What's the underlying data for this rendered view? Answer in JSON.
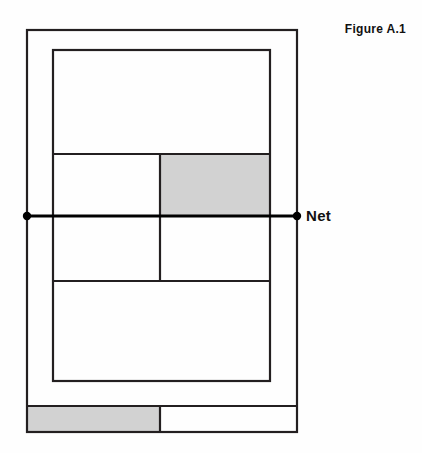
{
  "figure": {
    "caption": "Figure A.1",
    "title_text": "Figure A.1"
  },
  "labels": {
    "net": "Net",
    "caption": "Figure A.1"
  },
  "colors": {
    "background": "#fefefe",
    "line": "#231f20",
    "shade_fill": "#d2d2d2",
    "court_fill": "#ffffff",
    "post_fill": "#000000",
    "text": "#111111"
  },
  "geometry": {
    "doubles_court": {
      "x": 27,
      "y": 30,
      "width": 270,
      "height": 402
    },
    "singles_court": {
      "x": 53,
      "y": 50,
      "width": 217,
      "height": 331
    },
    "service_line_near": {
      "y": 154
    },
    "service_line_far": {
      "y": 281
    },
    "center_service_line": {
      "x": 160,
      "y1": 154,
      "y2": 281
    },
    "net_line": {
      "y": 216,
      "x1": 27,
      "x2": 297
    },
    "net_post_left": {
      "cx": 27,
      "cy": 216,
      "r": 4
    },
    "net_post_right": {
      "cx": 297,
      "cy": 216,
      "r": 4
    },
    "shaded_service_box": {
      "x": 160,
      "y": 154,
      "width": 110,
      "height": 62
    },
    "bottom_band": {
      "x": 27,
      "y": 406,
      "width": 270,
      "height": 26
    },
    "bottom_band_divider": {
      "x": 160
    },
    "shaded_bottom_left": {
      "x": 27,
      "y": 406,
      "width": 133,
      "height": 26
    }
  },
  "court_regions": [
    {
      "name": "doubles-alley-left",
      "shaded": false
    },
    {
      "name": "doubles-alley-right",
      "shaded": false
    },
    {
      "name": "backcourt-far",
      "shaded": false
    },
    {
      "name": "service-box-far-left",
      "shaded": false
    },
    {
      "name": "service-box-far-right",
      "shaded": true
    },
    {
      "name": "service-box-near-left",
      "shaded": false
    },
    {
      "name": "service-box-near-right",
      "shaded": false
    },
    {
      "name": "backcourt-near",
      "shaded": false
    },
    {
      "name": "bottom-band-left",
      "shaded": true
    },
    {
      "name": "bottom-band-right",
      "shaded": false
    }
  ],
  "line_widths": {
    "outer_boundary": 2.2,
    "inner_boundary": 2.2,
    "service_line": 2.2,
    "net": 3.0
  }
}
